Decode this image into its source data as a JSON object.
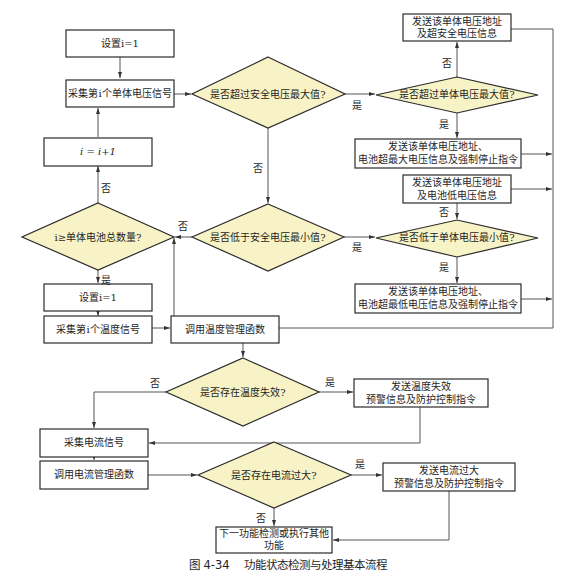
{
  "figure": {
    "caption": "图 4-34    功能状态检测与处理基本流程"
  },
  "colors": {
    "decision_fill": "#f7f3c6",
    "stroke": "#2b2b2b",
    "connector": "#555555"
  },
  "nodes": {
    "set_i_1_a": "设置i=1",
    "collect_cell_voltage": "采集第i个单体电压信号",
    "i_increment": "i = i+1",
    "check_i_total": "i≥单体电池总数量?",
    "check_over_safe_max": "是否超过安全电压最大值?",
    "check_under_safe_min": "是否低于安全电压最小值?",
    "send_over_safe": [
      "发送该单体电压地址",
      "及超安全电压信息"
    ],
    "check_over_cell_max": "是否超过单体电压最大值?",
    "send_over_max_stop": [
      "发送该单体电压地址、",
      "电池超最大电压信息及强制停止指令"
    ],
    "send_low_voltage": [
      "发送该单体电压地址",
      "及电池低电压信息"
    ],
    "check_under_cell_min": "是否低于单体电压最小值?",
    "send_under_min_stop": [
      "发送该单体电压地址、",
      "电池超最低电压信息及强制停止指令"
    ],
    "set_i_1_b": "设置i=1",
    "collect_temp": "采集第i个温度信号",
    "call_temp_mgmt": "调用温度管理函数",
    "check_temp_fail": "是否存在温度失效?",
    "send_temp_fail": [
      "发送温度失效",
      "预警信息及防护控制指令"
    ],
    "collect_current": "采集电流信号",
    "call_current_mgmt": "调用电流管理函数",
    "check_overcurrent": "是否存在电流过大?",
    "send_overcurrent": [
      "发送电流过大",
      "预警信息及防护控制指令"
    ],
    "next_function": [
      "下一功能检测或执行其他",
      "功能"
    ]
  },
  "edge_labels": {
    "yes": "是",
    "no": "否"
  }
}
